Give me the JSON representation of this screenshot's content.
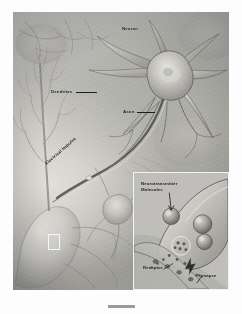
{
  "figure": {
    "style": "grayscale scientific airbrush illustration",
    "labels": {
      "neuron": "Neuron",
      "dendrites": "Dendrites",
      "axon": "Axon",
      "electrical_impulse": "Electrical Impulse"
    },
    "inset": {
      "name": "synapse-detail-inset",
      "labels": {
        "neurotransmitter_molecules": "Neurotransmitter Molecules",
        "receptor": "Receptor",
        "synapse": "Synapse"
      }
    },
    "callout_marker": {
      "name": "zoom-region-marker",
      "description": "white rectangle outline on left neuron body"
    }
  },
  "colors": {
    "page_background": "#fdfdfd",
    "illustration_mid": "#bebdb8",
    "illustration_dark": "#a3a29d",
    "illustration_light": "#e8e7e2",
    "label_text": "#171715",
    "inset_border": "#f2f2f0",
    "bottom_bar": "#9b9b99"
  },
  "bottom_bar": {
    "name": "caption-placeholder-bar"
  }
}
